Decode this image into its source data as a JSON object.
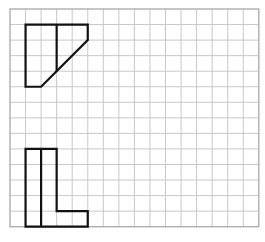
{
  "grid": {
    "origin_x": 10,
    "origin_y": 9,
    "cell": 15.55,
    "cols": 16,
    "rows": 14,
    "line_color": "#c8c8c8",
    "border_color": "#a8a8a8",
    "background": "#ffffff"
  },
  "shapes": {
    "stroke_color": "#111111",
    "stroke_width": 2.2,
    "top_figure": {
      "description": "Trapezoid-like shape with vertical divider and diagonal edge",
      "outline_cells": [
        [
          1,
          1
        ],
        [
          5,
          1
        ],
        [
          5,
          2
        ],
        [
          2,
          5
        ],
        [
          1,
          5
        ]
      ],
      "divider_cells": [
        [
          3,
          1
        ],
        [
          3,
          4
        ]
      ]
    },
    "bottom_figure": {
      "description": "L-shaped figure with vertical divider",
      "outline_cells": [
        [
          1,
          9
        ],
        [
          3,
          9
        ],
        [
          3,
          13
        ],
        [
          5,
          13
        ],
        [
          5,
          14
        ],
        [
          1,
          14
        ]
      ],
      "divider_cells": [
        [
          2,
          9
        ],
        [
          2,
          14
        ]
      ]
    }
  }
}
